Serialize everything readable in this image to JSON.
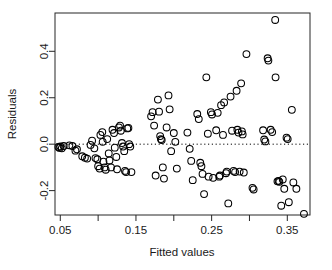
{
  "chart_data": {
    "type": "scatter",
    "title": "",
    "xlabel": "Fitted values",
    "ylabel": "Residuals",
    "xlim": [
      0.043,
      0.38
    ],
    "ylim": [
      -0.305,
      0.565
    ],
    "grid": false,
    "legend": null,
    "marker": "open-circle",
    "marker_color": "#000000",
    "reference_line": {
      "orientation": "horizontal",
      "y": 0.0,
      "style": "dotted",
      "color": "#000000"
    },
    "xticks": [
      0.05,
      0.1,
      0.15,
      0.2,
      0.25,
      0.3,
      0.35
    ],
    "xtick_labels": [
      "0.05",
      "",
      "0.15",
      "",
      "0.25",
      "",
      "0.35"
    ],
    "yticks": [
      -0.2,
      0.0,
      0.2,
      0.4
    ],
    "ytick_labels": [
      "-0.2",
      "0.0",
      "0.2",
      "0.4"
    ],
    "points": [
      {
        "x": 0.0475,
        "y": -0.012
      },
      {
        "x": 0.049,
        "y": -0.016
      },
      {
        "x": 0.05,
        "y": -0.01
      },
      {
        "x": 0.052,
        "y": -0.018
      },
      {
        "x": 0.0545,
        "y": -0.008
      },
      {
        "x": 0.062,
        "y": -0.005
      },
      {
        "x": 0.066,
        "y": -0.008
      },
      {
        "x": 0.07,
        "y": -0.028
      },
      {
        "x": 0.072,
        "y": -0.022
      },
      {
        "x": 0.079,
        "y": -0.052
      },
      {
        "x": 0.0825,
        "y": -0.058
      },
      {
        "x": 0.0855,
        "y": -0.062
      },
      {
        "x": 0.09,
        "y": -0.003
      },
      {
        "x": 0.092,
        "y": 0.015
      },
      {
        "x": 0.095,
        "y": -0.018
      },
      {
        "x": 0.0965,
        "y": -0.06
      },
      {
        "x": 0.099,
        "y": -0.065
      },
      {
        "x": 0.1,
        "y": -0.095
      },
      {
        "x": 0.102,
        "y": -0.105
      },
      {
        "x": 0.103,
        "y": 0.04
      },
      {
        "x": 0.1055,
        "y": 0.052
      },
      {
        "x": 0.106,
        "y": 0.01
      },
      {
        "x": 0.107,
        "y": -0.075
      },
      {
        "x": 0.1085,
        "y": -0.1
      },
      {
        "x": 0.11,
        "y": -0.11
      },
      {
        "x": 0.112,
        "y": 0.022
      },
      {
        "x": 0.114,
        "y": -0.04
      },
      {
        "x": 0.115,
        "y": -0.07
      },
      {
        "x": 0.117,
        "y": -0.1
      },
      {
        "x": 0.119,
        "y": 0.062
      },
      {
        "x": 0.121,
        "y": 0.048
      },
      {
        "x": 0.122,
        "y": -0.015
      },
      {
        "x": 0.124,
        "y": -0.055
      },
      {
        "x": 0.125,
        "y": -0.108
      },
      {
        "x": 0.1275,
        "y": 0.072
      },
      {
        "x": 0.129,
        "y": 0.08
      },
      {
        "x": 0.13,
        "y": 0.058
      },
      {
        "x": 0.1315,
        "y": 0.005
      },
      {
        "x": 0.133,
        "y": -0.01
      },
      {
        "x": 0.1345,
        "y": -0.03
      },
      {
        "x": 0.1355,
        "y": -0.115
      },
      {
        "x": 0.137,
        "y": -0.12
      },
      {
        "x": 0.1385,
        "y": 0.068
      },
      {
        "x": 0.14,
        "y": 0.07
      },
      {
        "x": 0.141,
        "y": 0.0
      },
      {
        "x": 0.1425,
        "y": -0.01
      },
      {
        "x": 0.144,
        "y": -0.12
      },
      {
        "x": 0.17,
        "y": 0.12
      },
      {
        "x": 0.172,
        "y": 0.138
      },
      {
        "x": 0.174,
        "y": 0.08
      },
      {
        "x": 0.176,
        "y": -0.135
      },
      {
        "x": 0.179,
        "y": 0.192
      },
      {
        "x": 0.1805,
        "y": 0.14
      },
      {
        "x": 0.182,
        "y": 0.035
      },
      {
        "x": 0.183,
        "y": 0.022
      },
      {
        "x": 0.184,
        "y": 0.018
      },
      {
        "x": 0.1855,
        "y": -0.1
      },
      {
        "x": 0.187,
        "y": -0.148
      },
      {
        "x": 0.1905,
        "y": 0.072
      },
      {
        "x": 0.193,
        "y": 0.21
      },
      {
        "x": 0.1945,
        "y": 0.15
      },
      {
        "x": 0.1965,
        "y": -0.03
      },
      {
        "x": 0.2,
        "y": 0.048
      },
      {
        "x": 0.202,
        "y": 0.01
      },
      {
        "x": 0.204,
        "y": -0.105
      },
      {
        "x": 0.218,
        "y": 0.05
      },
      {
        "x": 0.221,
        "y": -0.02
      },
      {
        "x": 0.223,
        "y": -0.072
      },
      {
        "x": 0.225,
        "y": -0.155
      },
      {
        "x": 0.231,
        "y": 0.13
      },
      {
        "x": 0.233,
        "y": 0.108
      },
      {
        "x": 0.235,
        "y": -0.08
      },
      {
        "x": 0.2365,
        "y": -0.095
      },
      {
        "x": 0.238,
        "y": -0.128
      },
      {
        "x": 0.24,
        "y": -0.215
      },
      {
        "x": 0.243,
        "y": 0.288
      },
      {
        "x": 0.245,
        "y": 0.045
      },
      {
        "x": 0.246,
        "y": -0.14
      },
      {
        "x": 0.249,
        "y": 0.138
      },
      {
        "x": 0.2505,
        "y": 0.128
      },
      {
        "x": 0.252,
        "y": -0.145
      },
      {
        "x": 0.256,
        "y": 0.06
      },
      {
        "x": 0.258,
        "y": 0.135
      },
      {
        "x": 0.26,
        "y": -0.14
      },
      {
        "x": 0.261,
        "y": -0.135
      },
      {
        "x": 0.2625,
        "y": 0.168
      },
      {
        "x": 0.265,
        "y": 0.04
      },
      {
        "x": 0.2665,
        "y": 0.18
      },
      {
        "x": 0.269,
        "y": -0.125
      },
      {
        "x": 0.27,
        "y": -0.118
      },
      {
        "x": 0.272,
        "y": -0.255
      },
      {
        "x": 0.275,
        "y": 0.205
      },
      {
        "x": 0.277,
        "y": 0.058
      },
      {
        "x": 0.279,
        "y": -0.115
      },
      {
        "x": 0.281,
        "y": -0.12
      },
      {
        "x": 0.283,
        "y": 0.23
      },
      {
        "x": 0.284,
        "y": 0.062
      },
      {
        "x": 0.2855,
        "y": 0.05
      },
      {
        "x": 0.287,
        "y": -0.118
      },
      {
        "x": 0.289,
        "y": 0.262
      },
      {
        "x": 0.29,
        "y": 0.055
      },
      {
        "x": 0.291,
        "y": 0.042
      },
      {
        "x": 0.2925,
        "y": -0.122
      },
      {
        "x": 0.296,
        "y": 0.388
      },
      {
        "x": 0.304,
        "y": -0.188
      },
      {
        "x": 0.3055,
        "y": -0.195
      },
      {
        "x": 0.318,
        "y": 0.06
      },
      {
        "x": 0.3195,
        "y": 0.02
      },
      {
        "x": 0.321,
        "y": 0.012
      },
      {
        "x": 0.324,
        "y": 0.37
      },
      {
        "x": 0.325,
        "y": 0.36
      },
      {
        "x": 0.328,
        "y": 0.062
      },
      {
        "x": 0.33,
        "y": 0.052
      },
      {
        "x": 0.334,
        "y": 0.535
      },
      {
        "x": 0.3345,
        "y": 0.288
      },
      {
        "x": 0.337,
        "y": -0.16
      },
      {
        "x": 0.3385,
        "y": -0.158
      },
      {
        "x": 0.3395,
        "y": -0.162
      },
      {
        "x": 0.342,
        "y": -0.265
      },
      {
        "x": 0.344,
        "y": -0.152
      },
      {
        "x": 0.346,
        "y": -0.192
      },
      {
        "x": 0.349,
        "y": 0.028
      },
      {
        "x": 0.3505,
        "y": 0.022
      },
      {
        "x": 0.352,
        "y": -0.25
      },
      {
        "x": 0.356,
        "y": 0.148
      },
      {
        "x": 0.358,
        "y": -0.165
      },
      {
        "x": 0.362,
        "y": -0.192
      },
      {
        "x": 0.372,
        "y": -0.3
      }
    ]
  }
}
